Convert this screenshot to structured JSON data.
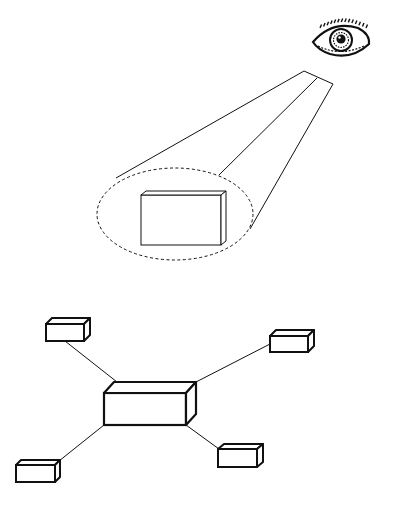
{
  "figure": {
    "width": 395,
    "height": 511,
    "background": "#ffffff",
    "stroke_color": "#111111"
  },
  "top_panel": {
    "observer": {
      "type": "eye-icon",
      "cx": 340,
      "cy": 40
    },
    "view_cone": {
      "apex_edge": [
        [
          304,
          71
        ],
        [
          333,
          84
        ]
      ],
      "rays": [
        {
          "from": [
            304,
            71
          ],
          "to": [
            116,
            178
          ]
        },
        {
          "from": [
            317,
            78
          ],
          "to": [
            219,
            175
          ]
        },
        {
          "from": [
            333,
            84
          ],
          "to": [
            250,
            229
          ]
        }
      ]
    },
    "focus_ellipse": {
      "cx": 175,
      "cy": 214,
      "rx": 78,
      "ry": 46,
      "style": "dashed"
    },
    "focused_object": {
      "shape": "box",
      "x": 141,
      "y": 195,
      "w": 80,
      "h": 50,
      "depth_dx": 5,
      "depth_dy": -4
    }
  },
  "bottom_panel": {
    "hub": {
      "name": "central-node",
      "shape": "box",
      "x": 104,
      "y": 393,
      "w": 82,
      "h": 32,
      "depth_dx": 10,
      "depth_dy": -11
    },
    "nodes": [
      {
        "name": "node-top-left",
        "x": 46,
        "y": 324,
        "w": 38,
        "h": 17,
        "depth_dx": 6,
        "depth_dy": -6,
        "link": [
          [
            65,
            341
          ],
          [
            117,
            382
          ]
        ]
      },
      {
        "name": "node-top-right",
        "x": 270,
        "y": 336,
        "w": 38,
        "h": 16,
        "depth_dx": 6,
        "depth_dy": -6,
        "link": [
          [
            196,
            382
          ],
          [
            270,
            344
          ]
        ]
      },
      {
        "name": "node-bottom-left",
        "x": 16,
        "y": 465,
        "w": 39,
        "h": 17,
        "depth_dx": 5,
        "depth_dy": -5,
        "link": [
          [
            104,
            425
          ],
          [
            59,
            461
          ]
        ]
      },
      {
        "name": "node-bottom-right",
        "x": 218,
        "y": 449,
        "w": 39,
        "h": 18,
        "depth_dx": 6,
        "depth_dy": -5,
        "link": [
          [
            186,
            425
          ],
          [
            219,
            449
          ]
        ]
      }
    ]
  }
}
